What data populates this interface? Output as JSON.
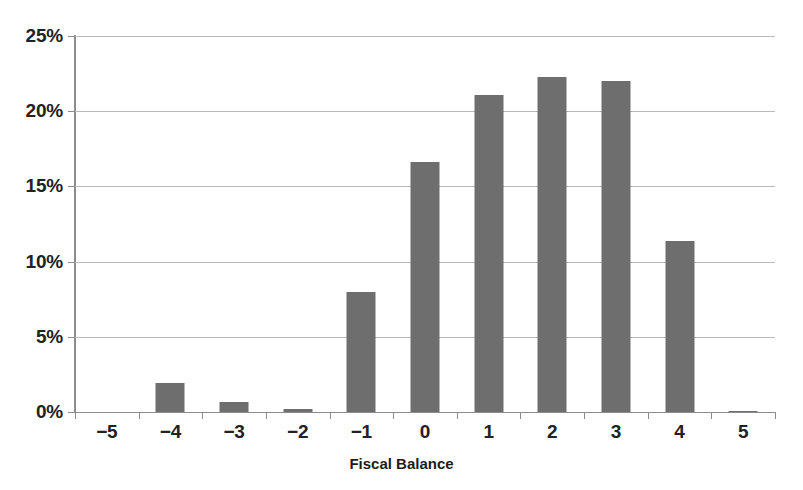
{
  "chart_data": {
    "type": "bar",
    "title": "",
    "subtitle": "",
    "xlabel": "Fiscal Balance",
    "ylabel": "",
    "categories": [
      "−5",
      "−4",
      "−3",
      "−2",
      "−1",
      "0",
      "1",
      "2",
      "3",
      "4",
      "5"
    ],
    "values": [
      0,
      1.9,
      0.65,
      0.2,
      8.0,
      16.6,
      21.1,
      22.3,
      22.0,
      11.4,
      0.1
    ],
    "value_unit": "%",
    "ylim": [
      0,
      25
    ],
    "y_tick_values": [
      0,
      5,
      10,
      15,
      20,
      25
    ],
    "y_tick_labels": [
      "0%",
      "5%",
      "10%",
      "15%",
      "20%",
      "25%"
    ],
    "grid": "horizontal",
    "legend": "none",
    "bar_color": "#6e6e6e",
    "gridline_color": "#b9b9b9",
    "axis_color": "#8c8c8c",
    "text_color": "#222222"
  },
  "artifacts": {
    "bottom_bleed_text": " "
  }
}
